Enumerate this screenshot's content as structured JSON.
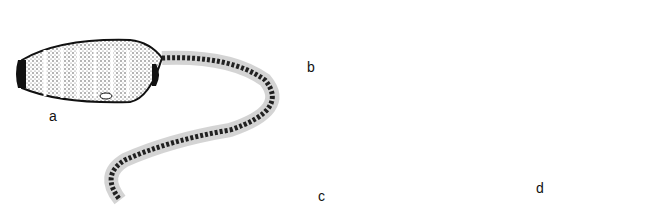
{
  "figure": {
    "panels": [
      {
        "id": "a",
        "label": "a",
        "subject": "segmented organism with feathery tail (colonial animal)"
      },
      {
        "id": "b",
        "label": "b",
        "subject": "elongated fish-like chordate (lancelet)"
      },
      {
        "id": "c",
        "label": "c",
        "subject": "crocodile"
      },
      {
        "id": "d",
        "label": "d",
        "subject": "elephant"
      }
    ],
    "colors": {
      "ink": "#111111",
      "background": "#ffffff",
      "shade": "#7a7a7a"
    }
  }
}
